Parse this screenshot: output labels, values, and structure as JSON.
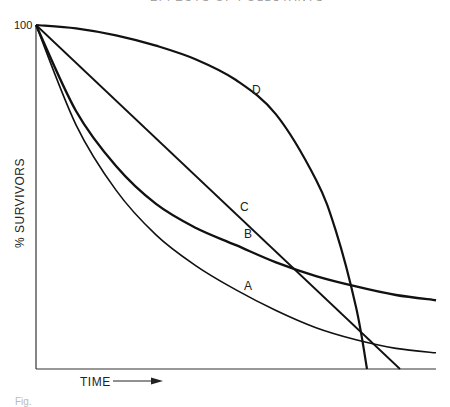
{
  "header": {
    "running_title": "EFFECTS OF POLLUTANTS"
  },
  "chart_data": {
    "type": "line",
    "title": "",
    "xlabel": "TIME",
    "ylabel": "% SURVIVORS",
    "y_tick_labels": [
      "100"
    ],
    "ylim": [
      0,
      100
    ],
    "xlim": [
      0,
      100
    ],
    "grid": false,
    "legend": "inline curve labels",
    "series": [
      {
        "name": "A",
        "label_pos": {
          "x": 52,
          "y": 23
        },
        "x": [
          0,
          10,
          20,
          30,
          40,
          50,
          60,
          70,
          80,
          90,
          100
        ],
        "y": [
          100,
          71,
          52,
          39,
          30,
          23,
          17,
          12,
          8.5,
          6,
          4.7
        ]
      },
      {
        "name": "B",
        "label_pos": {
          "x": 52,
          "y": 38
        },
        "x": [
          0,
          10,
          20,
          30,
          40,
          50,
          60,
          70,
          80,
          90,
          100
        ],
        "y": [
          100,
          75,
          59,
          48,
          41,
          36,
          31,
          27,
          24,
          21.5,
          20
        ]
      },
      {
        "name": "C",
        "label_pos": {
          "x": 51,
          "y": 46
        },
        "x": [
          0,
          91
        ],
        "y": [
          100,
          0
        ]
      },
      {
        "name": "D",
        "label_pos": {
          "x": 54,
          "y": 80
        },
        "x": [
          0,
          10,
          20,
          30,
          40,
          50,
          60,
          70,
          75,
          80,
          82.75
        ],
        "y": [
          100,
          99,
          97,
          94,
          90,
          84,
          74,
          55,
          40,
          18,
          0
        ]
      }
    ],
    "annotations": [
      "TIME →"
    ]
  },
  "caption": {
    "text": "Fig."
  }
}
